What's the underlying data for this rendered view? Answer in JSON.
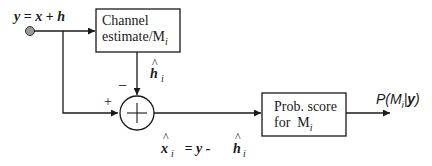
{
  "diagram": {
    "input": {
      "label_lhs": "y",
      "label_eq": " = ",
      "label_x": "x",
      "label_plus": " + ",
      "label_h": "h",
      "node_color": "#999999"
    },
    "channel_estimate_box": {
      "line1": "Channel",
      "line2_prefix": "estimate/M",
      "line2_sub": "i"
    },
    "estimate_signal": {
      "hat": "^",
      "symbol": "h",
      "sub": "i"
    },
    "summer": {
      "plus_sign": "+",
      "minus_sign": "−",
      "symbol": "+"
    },
    "residual_equation": {
      "hat_x": "^",
      "x": "x",
      "x_sub": "i",
      "eq": " = y - ",
      "hat_h": "^",
      "h": "h",
      "h_sub": "i"
    },
    "prob_score_box": {
      "line1": "Prob. score",
      "line2_prefix": "for  M",
      "line2_sub": "i"
    },
    "output": {
      "prefix": "P(M",
      "sub": "i",
      "bar": "|",
      "y": "y",
      "suffix": ")"
    },
    "colors": {
      "line": "#1a1a1a",
      "background": "#ffffff"
    }
  }
}
